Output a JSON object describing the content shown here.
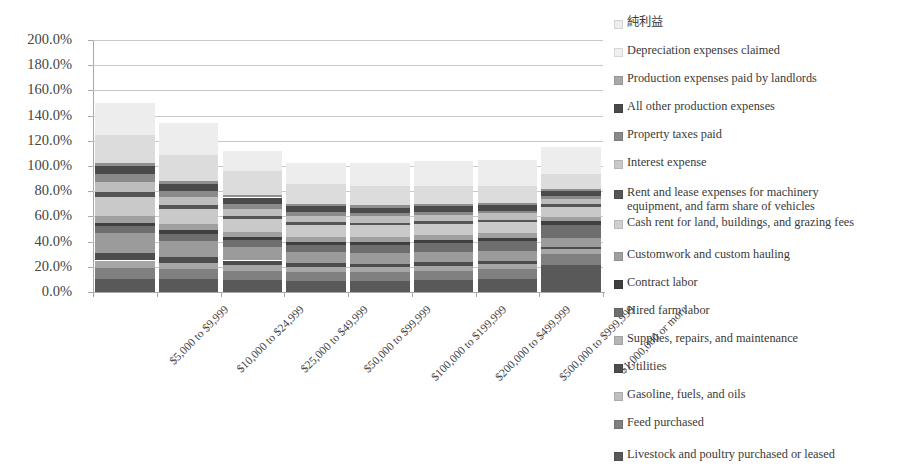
{
  "chart_data": {
    "type": "bar",
    "subtype": "stacked-bar-100-plus",
    "title": "",
    "xlabel": "",
    "ylabel": "",
    "ylim": [
      0,
      200
    ],
    "ytick_step": 20,
    "ytick_labels": [
      "0.0%",
      "20.0%",
      "40.0%",
      "60.0%",
      "80.0%",
      "100.0%",
      "120.0%",
      "140.0%",
      "160.0%",
      "180.0%",
      "200.0%"
    ],
    "grid": true,
    "legend_position": "right",
    "categories": [
      "$5,000 to $9,999",
      "$10,000 to $24,999",
      "$25,000 to $49,999",
      "$50,000 to $99,999",
      "$100,000 to $199,999",
      "$200,000 to $499,999",
      "$500,000 to $999,999",
      "$1,000,000 or more"
    ],
    "series": [
      {
        "name": "Livestock and poultry purchased or leased",
        "color": "#595959",
        "values": [
          10.5,
          10.0,
          9.5,
          9.0,
          9.0,
          9.5,
          10.0,
          21.5
        ]
      },
      {
        "name": "Feed purchased",
        "color": "#808080",
        "values": [
          8.5,
          8.0,
          7.5,
          7.0,
          7.0,
          7.5,
          8.0,
          9.0
        ]
      },
      {
        "name": "Gasoline, fuels, and oils",
        "color": "#a6a6a6",
        "values": [
          6.0,
          5.0,
          4.5,
          4.0,
          4.0,
          4.0,
          4.0,
          3.5
        ]
      },
      {
        "name": "Utilities",
        "color": "#4d4d4d",
        "values": [
          6.0,
          4.5,
          3.5,
          3.0,
          2.5,
          2.5,
          2.5,
          2.0
        ]
      },
      {
        "name": "Supplies, repairs, and maintenance",
        "color": "#9b9b9b",
        "values": [
          16.0,
          13.0,
          10.5,
          9.0,
          8.5,
          8.0,
          8.0,
          7.0
        ]
      },
      {
        "name": "Hired farm labor",
        "color": "#6e6e6e",
        "values": [
          5.0,
          5.5,
          5.5,
          5.5,
          6.0,
          7.0,
          8.0,
          10.5
        ]
      },
      {
        "name": "Contract labor",
        "color": "#3f3f3f",
        "values": [
          3.0,
          3.0,
          2.5,
          2.5,
          2.5,
          2.5,
          2.5,
          2.5
        ]
      },
      {
        "name": "Customwork and custom hauling",
        "color": "#a0a0a0",
        "values": [
          5.5,
          5.0,
          4.5,
          4.0,
          4.0,
          4.0,
          4.0,
          3.5
        ]
      },
      {
        "name": "Cash rent for land, buildings, and grazing fees",
        "color": "#c9c9c9",
        "values": [
          15.0,
          12.0,
          10.0,
          9.5,
          9.5,
          9.0,
          8.5,
          8.0
        ]
      },
      {
        "name": "Rent and lease expenses for machinery\nequipment, and farm share of vehicles",
        "color": "#555555",
        "values": [
          4.0,
          3.0,
          2.5,
          2.0,
          2.0,
          2.0,
          2.0,
          2.0
        ]
      },
      {
        "name": "Interest expense",
        "color": "#bdbdbd",
        "values": [
          8.0,
          6.5,
          5.5,
          5.0,
          5.0,
          5.0,
          5.0,
          4.5
        ]
      },
      {
        "name": "Property taxes paid",
        "color": "#8a8a8a",
        "values": [
          6.5,
          5.0,
          4.0,
          3.0,
          2.5,
          2.5,
          2.0,
          2.0
        ]
      },
      {
        "name": "All other production expenses",
        "color": "#4a4a4a",
        "values": [
          6.0,
          5.5,
          5.0,
          4.5,
          4.5,
          4.5,
          4.5,
          4.0
        ]
      },
      {
        "name": "Production expenses paid by landlords",
        "color": "#8f8f8f",
        "values": [
          2.0,
          2.0,
          2.0,
          2.0,
          2.0,
          2.0,
          2.0,
          2.0
        ]
      },
      {
        "name": "Depreciation expenses claimed",
        "color": "#dcdcdc",
        "values": [
          23.0,
          21.0,
          19.0,
          16.0,
          15.0,
          14.0,
          13.0,
          12.0
        ]
      },
      {
        "name": "純利益",
        "color": "#ededed",
        "values": [
          25.0,
          25.0,
          16.0,
          16.0,
          18.0,
          20.0,
          21.0,
          21.0
        ]
      }
    ],
    "bar_totals": [
      200.0,
      148.0,
      112.0,
      101.5,
      102.0,
      104.0,
      105.0,
      115.0
    ]
  },
  "legend": {
    "items": [
      {
        "label": "純利益",
        "color": "#ededed"
      },
      {
        "label": "Depreciation expenses claimed",
        "color": "#f0f0f0"
      },
      {
        "label": "Production expenses paid by landlords",
        "color": "#a8a8a8"
      },
      {
        "label": "All other production expenses",
        "color": "#4a4a4a"
      },
      {
        "label": "Property taxes paid",
        "color": "#8a8a8a"
      },
      {
        "label": "Interest expense",
        "color": "#c9c9c9"
      },
      {
        "label": "Rent and lease expenses for machinery\nequipment, and farm share of vehicles",
        "color": "#555555"
      },
      {
        "label": "Cash rent for land, buildings, and grazing fees",
        "color": "#cfcfcf"
      },
      {
        "label": "Customwork and custom hauling",
        "color": "#a0a0a0"
      },
      {
        "label": "Contract labor",
        "color": "#3f3f3f"
      },
      {
        "label": "Hired farm labor",
        "color": "#6e6e6e"
      },
      {
        "label": "Supplies, repairs, and maintenance",
        "color": "#b5b5b5"
      },
      {
        "label": "Utilities",
        "color": "#4d4d4d"
      },
      {
        "label": "Gasoline, fuels, and oils",
        "color": "#bfbfbf"
      },
      {
        "label": "Feed purchased",
        "color": "#808080"
      },
      {
        "label": "Livestock and poultry purchased or leased",
        "color": "#595959"
      }
    ]
  }
}
